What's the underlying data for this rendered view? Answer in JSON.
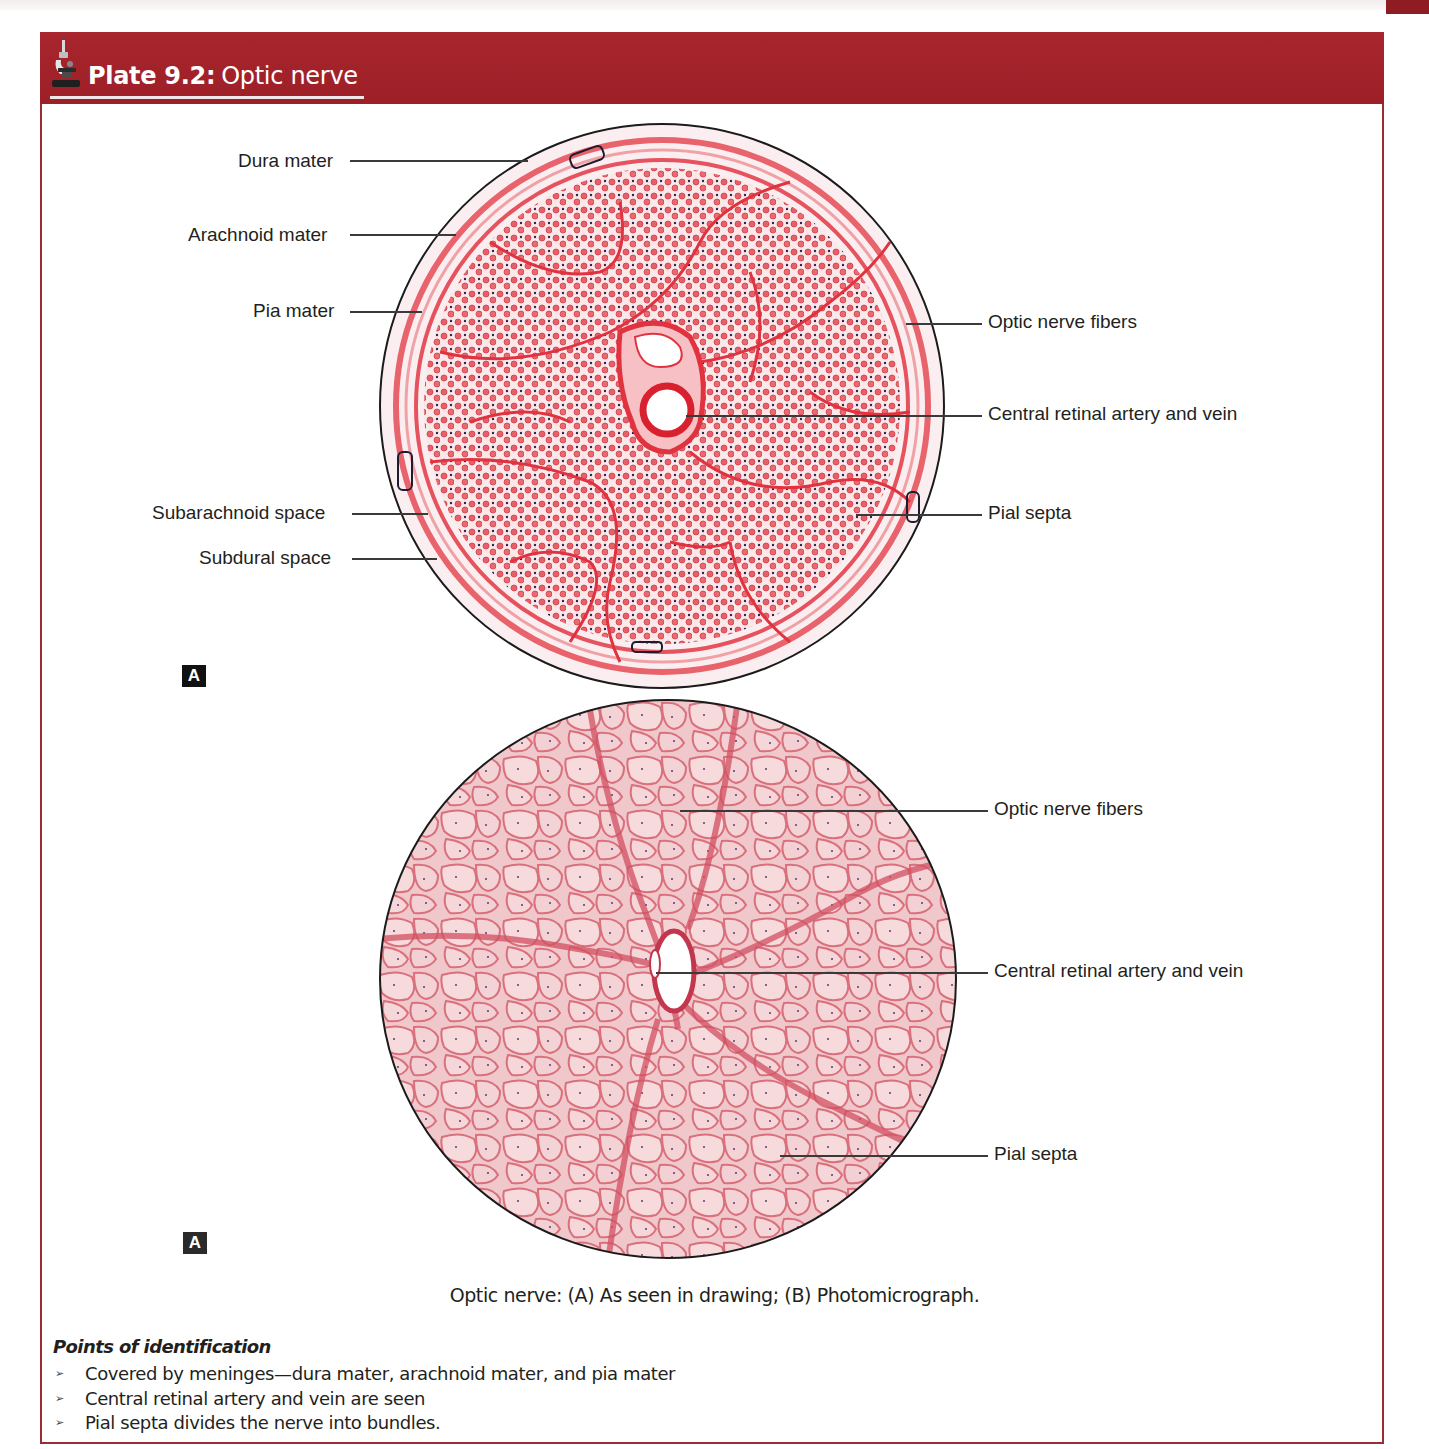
{
  "page": {
    "running_header": "",
    "accent_color": "#a3222a",
    "border_color": "#9b2c33"
  },
  "plate": {
    "icon": "microscope-icon",
    "number": "Plate 9.2:",
    "title": "Optic nerve"
  },
  "figure_a": {
    "badge": "A",
    "type": "drawing",
    "labels_left": [
      {
        "text": "Dura mater"
      },
      {
        "text": "Arachnoid mater"
      },
      {
        "text": "Pia mater"
      },
      {
        "text": "Subarachnoid space"
      },
      {
        "text": "Subdural space"
      }
    ],
    "labels_right": [
      {
        "text": "Optic nerve fibers"
      },
      {
        "text": "Central retinal artery and vein"
      },
      {
        "text": "Pial septa"
      }
    ]
  },
  "figure_b": {
    "badge": "A",
    "type": "photomicrograph",
    "labels_right": [
      {
        "text": "Optic nerve fibers"
      },
      {
        "text": "Central retinal artery and vein"
      },
      {
        "text": "Pial septa"
      }
    ]
  },
  "caption": "Optic nerve: (A) As seen in drawing; (B) Photomicrograph.",
  "points": {
    "title": "Points of identification",
    "bullet_glyph": "➢",
    "items": [
      "Covered by meninges—dura mater, arachnoid mater, and pia mater",
      "Central retinal artery and vein are seen",
      "Pial septa divides the nerve into bundles."
    ]
  }
}
